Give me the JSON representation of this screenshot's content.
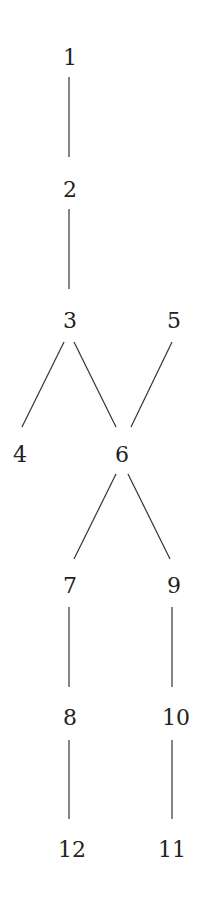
{
  "diagram": {
    "type": "hasse-diagram",
    "nodes": [
      {
        "id": "1",
        "label": "1",
        "x": 70,
        "y": 58
      },
      {
        "id": "2",
        "label": "2",
        "x": 70,
        "y": 190
      },
      {
        "id": "3",
        "label": "3",
        "x": 70,
        "y": 321
      },
      {
        "id": "5",
        "label": "5",
        "x": 174,
        "y": 321
      },
      {
        "id": "4",
        "label": "4",
        "x": 20,
        "y": 455
      },
      {
        "id": "6",
        "label": "6",
        "x": 122,
        "y": 455
      },
      {
        "id": "7",
        "label": "7",
        "x": 70,
        "y": 586
      },
      {
        "id": "9",
        "label": "9",
        "x": 174,
        "y": 586
      },
      {
        "id": "8",
        "label": "8",
        "x": 70,
        "y": 718
      },
      {
        "id": "10",
        "label": "10",
        "x": 176,
        "y": 718
      },
      {
        "id": "12",
        "label": "12",
        "x": 72,
        "y": 850
      },
      {
        "id": "11",
        "label": "11",
        "x": 172,
        "y": 850
      }
    ],
    "edges": [
      {
        "from": "1",
        "to": "2",
        "x1": 69,
        "y1": 77,
        "x2": 69,
        "y2": 157
      },
      {
        "from": "2",
        "to": "3",
        "x1": 69,
        "y1": 209,
        "x2": 69,
        "y2": 289
      },
      {
        "from": "3",
        "to": "4",
        "x1": 64,
        "y1": 342,
        "x2": 22,
        "y2": 427
      },
      {
        "from": "3",
        "to": "6",
        "x1": 74,
        "y1": 342,
        "x2": 116,
        "y2": 427
      },
      {
        "from": "5",
        "to": "6",
        "x1": 172,
        "y1": 342,
        "x2": 131,
        "y2": 427
      },
      {
        "from": "6",
        "to": "7",
        "x1": 116,
        "y1": 474,
        "x2": 74,
        "y2": 559
      },
      {
        "from": "6",
        "to": "9",
        "x1": 128,
        "y1": 474,
        "x2": 170,
        "y2": 559
      },
      {
        "from": "7",
        "to": "8",
        "x1": 69,
        "y1": 607,
        "x2": 69,
        "y2": 687
      },
      {
        "from": "9",
        "to": "10",
        "x1": 172,
        "y1": 607,
        "x2": 172,
        "y2": 687
      },
      {
        "from": "8",
        "to": "12",
        "x1": 69,
        "y1": 740,
        "x2": 69,
        "y2": 819
      },
      {
        "from": "10",
        "to": "11",
        "x1": 172,
        "y1": 740,
        "x2": 172,
        "y2": 819
      }
    ]
  }
}
